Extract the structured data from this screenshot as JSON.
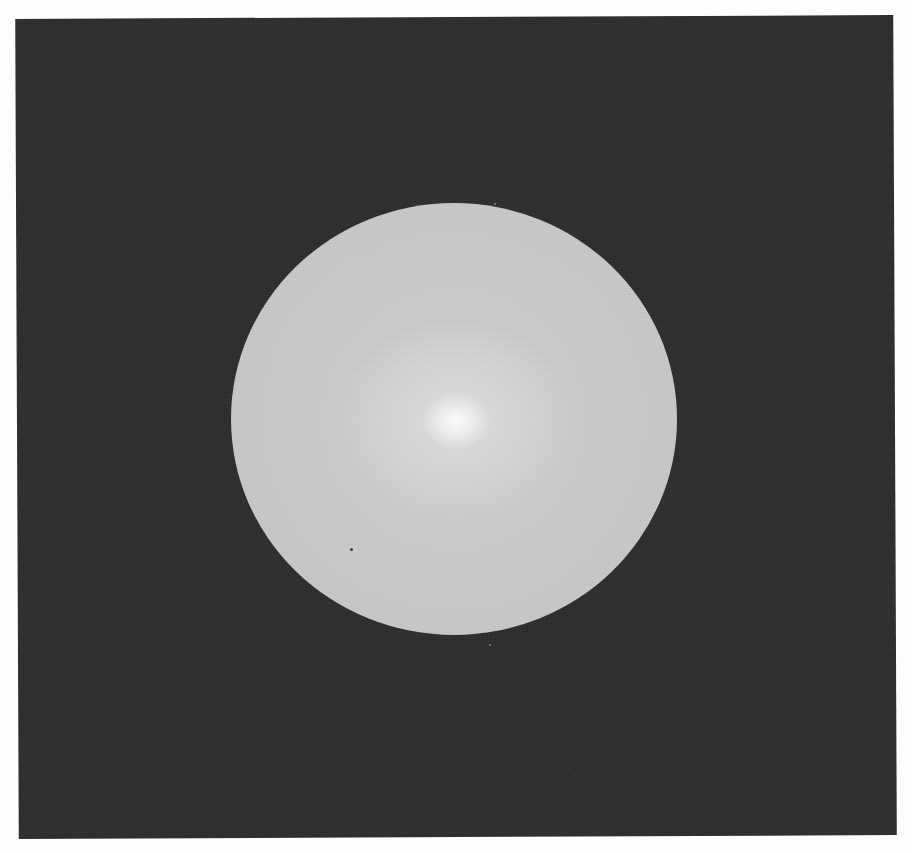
{
  "image": {
    "description": "Grayscale photograph-like render of a light grey sphere with a soft white specular highlight, centered on a dark grey textured square background with a thin white margin.",
    "subject": "sphere",
    "colors": {
      "margin": "#fdfdfd",
      "background_panel": "#2c2c2c",
      "sphere_body": "#c9c9c9",
      "sphere_highlight": "#fbfbfb"
    }
  }
}
